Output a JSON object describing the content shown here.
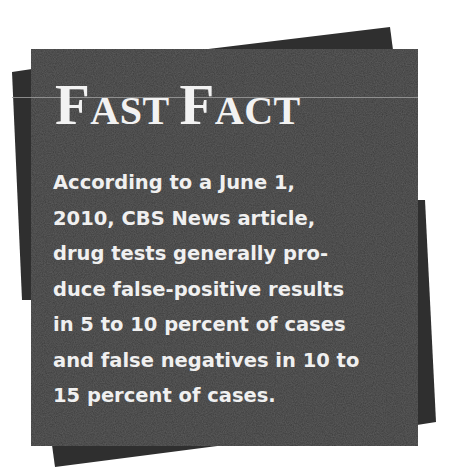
{
  "callout": {
    "title_parts": [
      {
        "initial": "F",
        "rest": "AST"
      },
      {
        "initial": "F",
        "rest": "ACT"
      }
    ],
    "title": "Fast Fact",
    "body_lines": [
      "According to a June 1,",
      "2010, CBS News article,",
      "drug tests generally pro-",
      "duce false-positive results",
      "in 5 to 10 percent of cases",
      "and false negatives in 10 to",
      "15 percent of cases."
    ]
  },
  "colors": {
    "card": "#3b3b3b",
    "back_sheet": "#2e2e2e",
    "text": "#f2f2f2",
    "background": "#ffffff"
  }
}
